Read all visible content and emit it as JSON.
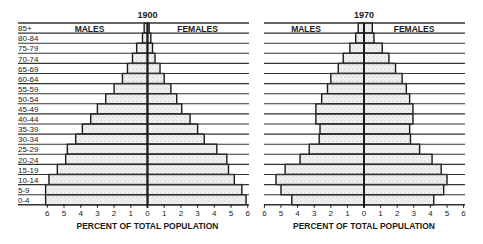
{
  "chart_data": [
    {
      "type": "bar",
      "subtype": "population-pyramid",
      "title": "1900",
      "left_series_label": "MALES",
      "right_series_label": "FEMALES",
      "xlabel": "PERCENT OF TOTAL POPULATION",
      "ylabel": "",
      "xlim": [
        6,
        6
      ],
      "xticks": [
        "6",
        "5",
        "4",
        "3",
        "2",
        "1",
        "0",
        "1",
        "2",
        "3",
        "4",
        "5",
        "6"
      ],
      "categories": [
        "85+",
        "80-84",
        "75-79",
        "70-74",
        "65-69",
        "60-64",
        "55-59",
        "50-54",
        "45-49",
        "40-44",
        "35-39",
        "30-34",
        "25-29",
        "20-24",
        "15-19",
        "10-14",
        "5-9",
        "0-4"
      ],
      "series": [
        {
          "name": "Males",
          "values": [
            0.2,
            0.3,
            0.65,
            0.9,
            1.2,
            1.5,
            2.0,
            2.5,
            3.0,
            3.4,
            3.9,
            4.3,
            4.8,
            4.9,
            5.4,
            5.9,
            6.1,
            null
          ]
        },
        {
          "name": "Females",
          "values": [
            0.1,
            0.2,
            0.3,
            0.45,
            0.75,
            1.0,
            1.4,
            1.75,
            2.05,
            2.55,
            3.0,
            3.4,
            4.15,
            4.75,
            4.85,
            5.2,
            5.65,
            5.9
          ]
        }
      ],
      "grid": "horizontal-row-lines",
      "legend": "inline-top"
    },
    {
      "type": "bar",
      "subtype": "population-pyramid",
      "title": "1970",
      "left_series_label": "MALES",
      "right_series_label": "FEMALES",
      "xlabel": "PERCENT OF TOTAL POPULATION",
      "ylabel": "",
      "xlim": [
        6,
        6
      ],
      "xticks": [
        "6",
        "5",
        "4",
        "3",
        "2",
        "1",
        "0",
        "1",
        "2",
        "3",
        "4",
        "5",
        "6"
      ],
      "categories": [
        "85+",
        "80-84",
        "75-79",
        "70-74",
        "65-69",
        "60-64",
        "55-59",
        "50-54",
        "45-49",
        "40-44",
        "35-39",
        "30-34",
        "25-29",
        "20-24",
        "15-19",
        "10-14",
        "5-9",
        "0-4"
      ],
      "series": [
        {
          "name": "Males",
          "values": [
            0.35,
            0.5,
            0.85,
            1.25,
            1.55,
            2.0,
            2.2,
            2.55,
            2.9,
            2.9,
            2.65,
            2.7,
            3.3,
            3.85,
            4.75,
            5.3,
            5.0,
            4.35
          ]
        },
        {
          "name": "Females",
          "values": [
            0.5,
            0.6,
            1.1,
            1.5,
            1.9,
            2.3,
            2.55,
            2.75,
            2.95,
            2.95,
            2.75,
            2.8,
            3.35,
            4.1,
            4.65,
            5.0,
            4.8,
            4.2
          ]
        }
      ],
      "grid": "horizontal-row-lines",
      "legend": "inline-top"
    }
  ],
  "age_labels": [
    "85+",
    "80-84",
    "75-79",
    "70-74",
    "65-69",
    "60-64",
    "55-59",
    "50-54",
    "45-49",
    "40-44",
    "35-39",
    "30-34",
    "25-29",
    "20-24",
    "15-19",
    "10-14",
    "5-9",
    "0-4"
  ],
  "colors": {
    "ink": "#1a1a1a",
    "bar_fill": "#eeeeee",
    "rule": "#333333",
    "background": "#ffffff"
  }
}
